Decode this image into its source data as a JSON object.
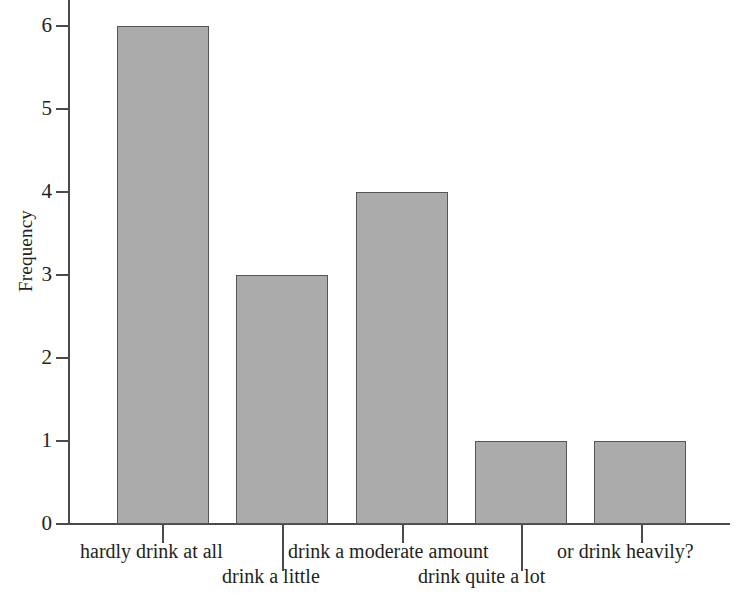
{
  "chart_data": {
    "type": "bar",
    "title": "",
    "xlabel": "",
    "ylabel": "Frequency",
    "categories": [
      "hardly drink at all",
      "drink a little",
      "drink a moderate amount",
      "drink quite a lot",
      "or drink heavily?"
    ],
    "values": [
      6,
      3,
      4,
      1,
      1
    ],
    "ylim": [
      0,
      6
    ],
    "yticks": [
      "0",
      "1",
      "2",
      "3",
      "4",
      "5",
      "6"
    ],
    "grid": false,
    "legend": false,
    "bar_color": "#ababab",
    "bar_border_color": "#555555",
    "axis_color": "#4a4a4a",
    "background": "#ffffff"
  }
}
